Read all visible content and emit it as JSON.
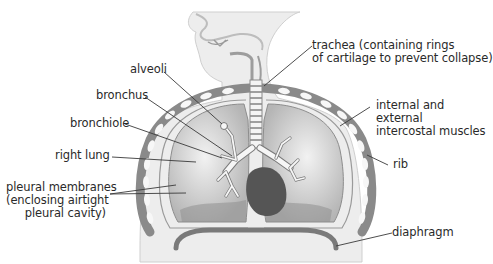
{
  "figure": {
    "title_fragment": "the lung (cropped)",
    "labels": {
      "alveoli": "alveoli",
      "bronchus": "bronchus",
      "bronchiole": "bronchiole",
      "right_lung": "right lung",
      "pleural_1": "pleural membranes",
      "pleural_2": "(enclosing airtight",
      "pleural_3": "pleural cavity)",
      "trachea_1": "trachea (containing rings",
      "trachea_2": "of cartilage to prevent collapse)",
      "intercostal_1": "internal and",
      "intercostal_2": "external",
      "intercostal_3": "intercostal muscles",
      "rib": "rib",
      "diaphragm": "diaphragm"
    },
    "colors": {
      "body": "#eeeeee",
      "lung": "#c8c8c8",
      "heart": "#555555",
      "rib": "#888888",
      "text": "#2a2a2a"
    }
  }
}
